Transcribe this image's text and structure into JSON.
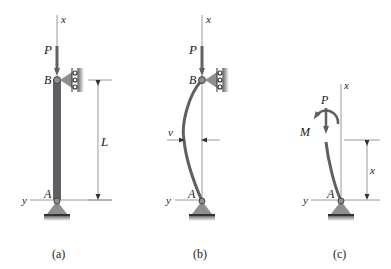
{
  "figure": {
    "panels": [
      {
        "caption": "(a)",
        "labels": {
          "axis_x": "x",
          "axis_y": "y",
          "load": "P",
          "top_pin": "B",
          "bottom_pin": "A",
          "length": "L"
        },
        "state": "straight column"
      },
      {
        "caption": "(b)",
        "labels": {
          "axis_x": "x",
          "axis_y": "y",
          "load": "P",
          "top_pin": "B",
          "bottom_pin": "A",
          "deflection": "v"
        },
        "state": "buckled column"
      },
      {
        "caption": "(c)",
        "labels": {
          "axis_x": "x",
          "axis_y": "y",
          "load": "P",
          "moment": "M",
          "bottom_pin": "A",
          "section_height": "x"
        },
        "state": "free-body section"
      }
    ],
    "colors": {
      "member": "#5f6064",
      "support": "#8d8e90",
      "line": "#9a9a9a",
      "text": "#1a1a1a"
    }
  }
}
